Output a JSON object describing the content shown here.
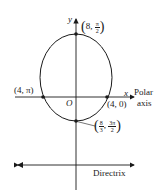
{
  "diagram": {
    "type": "polar conic (ellipse) with directrix",
    "axes": {
      "y_label": "y",
      "x_label": "x",
      "origin_label": "O",
      "polar_axis_label_line1": "Polar",
      "polar_axis_label_line2": "axis"
    },
    "points": {
      "top": {
        "r": "8",
        "theta_num": "π",
        "theta_den": "2"
      },
      "left": {
        "label": "(4, π)"
      },
      "right": {
        "label": "(4, 0)"
      },
      "bottom": {
        "r_num": "8",
        "r_den": "3",
        "theta_num": "3π",
        "theta_den": "2"
      }
    },
    "directrix_label": "Directrix",
    "colors": {
      "stroke": "#1a1a1a",
      "background": "#ffffff"
    }
  }
}
